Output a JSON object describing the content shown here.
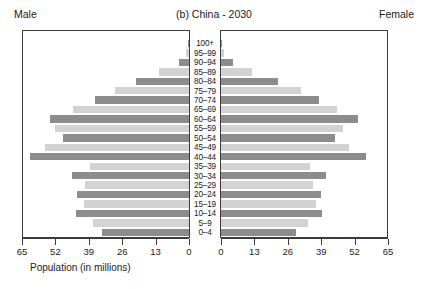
{
  "header": {
    "male_label": "Male",
    "female_label": "Female",
    "title": "(b)  China - 2030"
  },
  "axis": {
    "xlabel": "Population (in millions)",
    "left_ticks": [
      "65",
      "52",
      "39",
      "26",
      "13",
      "0"
    ],
    "right_ticks": [
      "0",
      "13",
      "26",
      "39",
      "52",
      "65"
    ]
  },
  "colors": {
    "bar_dark": "#8c8c8c",
    "bar_light": "#d2d2d2",
    "axis": "#3c3c3c",
    "text": "#1a1a1a"
  },
  "chart_data": {
    "type": "bar",
    "title": "(b)  China - 2030",
    "xlabel": "Population (in millions)",
    "ylabel": "",
    "xlim": [
      0,
      65
    ],
    "grid": false,
    "orientation": "population-pyramid",
    "categories": [
      "0-4",
      "5-9",
      "10-14",
      "15-19",
      "20-24",
      "25-29",
      "30-34",
      "35-39",
      "40-44",
      "45-49",
      "50-54",
      "55-59",
      "60-64",
      "65-69",
      "70-74",
      "75-79",
      "80-84",
      "85-89",
      "90-94",
      "95-99",
      "100+"
    ],
    "series": [
      {
        "name": "Male",
        "values": [
          34.0,
          37.5,
          44.0,
          41.0,
          43.5,
          40.5,
          45.5,
          38.5,
          62.0,
          56.0,
          49.0,
          52.0,
          54.0,
          45.0,
          36.5,
          29.0,
          20.5,
          11.5,
          4.0,
          1.0,
          0.3
        ]
      },
      {
        "name": "Female",
        "values": [
          29.0,
          34.0,
          39.5,
          37.0,
          39.0,
          36.0,
          41.0,
          34.5,
          56.5,
          50.0,
          44.5,
          47.5,
          53.5,
          45.0,
          38.0,
          31.0,
          22.0,
          12.0,
          4.5,
          1.2,
          0.3
        ]
      }
    ],
    "legend": [
      "Male",
      "Female"
    ],
    "legend_position": "top-left-and-top-right"
  }
}
